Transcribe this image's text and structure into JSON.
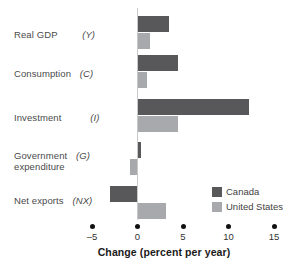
{
  "chart_data": {
    "type": "bar",
    "orientation": "horizontal",
    "title": "",
    "xlabel": "Change (percent per year)",
    "ylabel": "",
    "xlim": [
      -5,
      15
    ],
    "xticks": [
      -5,
      0,
      5,
      10,
      15
    ],
    "xticklabels": [
      "–5",
      "0",
      "5",
      "10",
      "15"
    ],
    "grid": false,
    "legend_position": "bottom-right",
    "categories": [
      "Real GDP",
      "Consumption",
      "Investment",
      "Government expenditure",
      "Net exports"
    ],
    "category_symbols": [
      "(Y)",
      "(C)",
      "(I)",
      "(G)",
      "(NX)"
    ],
    "series": [
      {
        "name": "Canada",
        "color": "#58585a",
        "values": [
          3.5,
          4.4,
          12.3,
          0.4,
          -3.0
        ]
      },
      {
        "name": "United States",
        "color": "#a7a9ac",
        "values": [
          1.4,
          1.0,
          4.4,
          -0.8,
          3.1
        ]
      }
    ]
  },
  "labels": {
    "rows": [
      {
        "name": "Real GDP",
        "symbol": "(Y)",
        "name2": ""
      },
      {
        "name": "Consumption",
        "symbol": "(C)",
        "name2": ""
      },
      {
        "name": "Investment",
        "symbol": "(I)",
        "name2": ""
      },
      {
        "name": "Government",
        "symbol": "(G)",
        "name2": "expenditure"
      },
      {
        "name": "Net exports",
        "symbol": "(NX)",
        "name2": ""
      }
    ]
  },
  "axis": {
    "title": "Change (percent per year)",
    "ticks": [
      "–5",
      "0",
      "5",
      "10",
      "15"
    ]
  },
  "legend": {
    "items": [
      {
        "label": "Canada",
        "color": "#58585a"
      },
      {
        "label": "United States",
        "color": "#a7a9ac"
      }
    ]
  }
}
